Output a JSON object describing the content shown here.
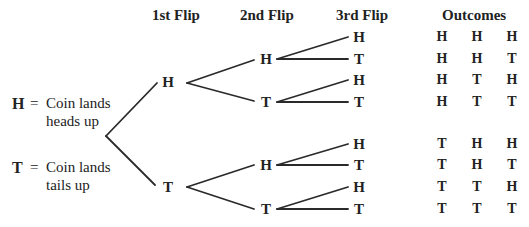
{
  "headers": {
    "first": "1st Flip",
    "second": "2nd Flip",
    "third": "3rd Flip",
    "outcomes": "Outcomes"
  },
  "legend": {
    "heads": {
      "symbol": "H",
      "equals": "=",
      "line1": "Coin lands",
      "line2": "heads up"
    },
    "tails": {
      "symbol": "T",
      "equals": "=",
      "line1": "Coin lands",
      "line2": "tails up"
    }
  },
  "tree": {
    "first": [
      "H",
      "T"
    ],
    "second": [
      "H",
      "T",
      "H",
      "T"
    ],
    "third": [
      "H",
      "T",
      "H",
      "T",
      "H",
      "T",
      "H",
      "T"
    ]
  },
  "outcomes": [
    [
      "H",
      "H",
      "H"
    ],
    [
      "H",
      "H",
      "T"
    ],
    [
      "H",
      "T",
      "H"
    ],
    [
      "H",
      "T",
      "T"
    ],
    [
      "T",
      "H",
      "H"
    ],
    [
      "T",
      "H",
      "T"
    ],
    [
      "T",
      "T",
      "H"
    ],
    [
      "T",
      "T",
      "T"
    ]
  ]
}
